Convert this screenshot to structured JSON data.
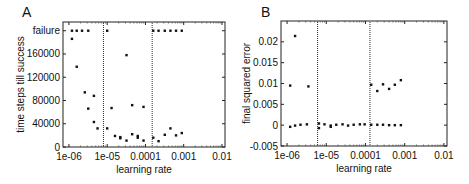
{
  "chart_data": [
    {
      "panel": "A",
      "type": "scatter",
      "title": "",
      "xlabel": "learning rate",
      "ylabel": "time steps till success",
      "xscale": "log",
      "xlim": [
        7e-07,
        0.012
      ],
      "ylim": [
        0,
        215000
      ],
      "xticks": [
        1e-06,
        1e-05,
        0.0001,
        0.001,
        0.01
      ],
      "xtick_labels": [
        "1e-06",
        "1e-05",
        "0.0001",
        "0.001",
        "0.01"
      ],
      "yticks": [
        0,
        40000,
        80000,
        120000,
        160000,
        200000
      ],
      "ytick_labels": [
        "0",
        "40000",
        "80000",
        "120000",
        "160000",
        "failure"
      ],
      "grid": false,
      "vlines": [
        8e-06,
        0.00015
      ],
      "series": [
        {
          "name": "runs",
          "points": [
            [
              1.2e-06,
              200000
            ],
            [
              1.6e-06,
              200000
            ],
            [
              2.2e-06,
              200000
            ],
            [
              3.2e-06,
              200000
            ],
            [
              1e-05,
              200000
            ],
            [
              1.2e-06,
              186000
            ],
            [
              1.6e-06,
              138000
            ],
            [
              2.6e-06,
              94000
            ],
            [
              3.2e-06,
              66000
            ],
            [
              4.5e-06,
              88000
            ],
            [
              4.5e-06,
              43000
            ],
            [
              5.6e-06,
              32000
            ],
            [
              1e-05,
              32000
            ],
            [
              1.3e-05,
              67000
            ],
            [
              1.6e-05,
              19000
            ],
            [
              2.2e-05,
              17000
            ],
            [
              2.2e-05,
              15000
            ],
            [
              3.2e-05,
              11000
            ],
            [
              3.2e-05,
              158000
            ],
            [
              4.5e-05,
              72000
            ],
            [
              4.5e-05,
              22000
            ],
            [
              6.3e-05,
              19000
            ],
            [
              6.3e-05,
              16000
            ],
            [
              8.9e-05,
              69000
            ],
            [
              8.9e-05,
              11000
            ],
            [
              0.00016,
              200000
            ],
            [
              0.00022,
              200000
            ],
            [
              0.00032,
              200000
            ],
            [
              0.00045,
              200000
            ],
            [
              0.00063,
              200000
            ],
            [
              0.00089,
              200000
            ],
            [
              0.00016,
              16000
            ],
            [
              0.00022,
              10000
            ],
            [
              0.00032,
              21000
            ],
            [
              0.00045,
              32000
            ],
            [
              0.00063,
              20000
            ],
            [
              0.00089,
              24000
            ]
          ]
        }
      ]
    },
    {
      "panel": "B",
      "type": "scatter",
      "title": "",
      "xlabel": "learning rate",
      "ylabel": "final squared error",
      "xscale": "log",
      "xlim": [
        7e-07,
        0.012
      ],
      "ylim": [
        -0.005,
        0.025
      ],
      "xticks": [
        1e-06,
        1e-05,
        0.0001,
        0.001,
        0.01
      ],
      "xtick_labels": [
        "1e-06",
        "1e-05",
        "0.0001",
        "0.001",
        "0.01"
      ],
      "yticks": [
        -0.005,
        0,
        0.005,
        0.01,
        0.015,
        0.02
      ],
      "ytick_labels": [
        "-0.005",
        "0",
        "0.005",
        "0.01",
        "0.015",
        "0.02"
      ],
      "grid": false,
      "vlines": [
        6e-06,
        0.00013
      ],
      "series": [
        {
          "name": "runs",
          "points": [
            [
              1.2e-06,
              0.0095
            ],
            [
              1.6e-06,
              0.0214
            ],
            [
              3.5e-06,
              0.0093
            ],
            [
              1.2e-06,
              -0.0004
            ],
            [
              1.6e-06,
              -0.0001
            ],
            [
              2.2e-06,
              0.0001
            ],
            [
              3.2e-06,
              0.0002
            ],
            [
              6.5e-06,
              0.0004
            ],
            [
              6.5e-06,
              -0.0007
            ],
            [
              9e-06,
              0.0002
            ],
            [
              1.3e-05,
              -0.0001
            ],
            [
              1.3e-05,
              -0.0004
            ],
            [
              1.8e-05,
              0.0001
            ],
            [
              2.6e-05,
              0.0002
            ],
            [
              3.6e-05,
              -0.0001
            ],
            [
              5e-05,
              0.0001
            ],
            [
              7.2e-05,
              0.0002
            ],
            [
              9.5e-05,
              0.0002
            ],
            [
              0.00014,
              0.0001
            ],
            [
              0.0002,
              0.0001
            ],
            [
              0.00028,
              0.0001
            ],
            [
              0.0004,
              0.0
            ],
            [
              0.00056,
              0.0
            ],
            [
              0.0008,
              0.0
            ],
            [
              0.00014,
              0.0097
            ],
            [
              0.0002,
              0.0082
            ],
            [
              0.00028,
              0.0098
            ],
            [
              0.0004,
              0.0087
            ],
            [
              0.00056,
              0.0097
            ],
            [
              0.0008,
              0.0108
            ]
          ]
        }
      ]
    }
  ],
  "panels": {
    "a": {
      "label": "A",
      "ylabel": "time steps till success",
      "xlabel": "learning rate"
    },
    "b": {
      "label": "B",
      "ylabel": "final squared error",
      "xlabel": "learning rate"
    }
  }
}
